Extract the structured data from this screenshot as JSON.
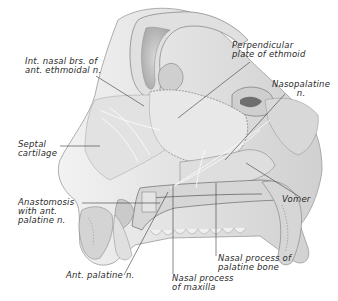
{
  "figure": {
    "colors": {
      "background": "#ffffff",
      "ink": "#2a2a2a",
      "bone_shade": "#b8b8b8",
      "soft_tissue": "#dcdcdc",
      "light_fill": "#ececec",
      "nerve": "#f4f4f4"
    },
    "labels": [
      {
        "id": "int-nasal-brs",
        "lines": [
          "Int. nasal brs. of",
          "ant. ethmoidal n."
        ]
      },
      {
        "id": "perpendicular-plate",
        "lines": [
          "Perpendicular",
          "plate of ethmoid"
        ]
      },
      {
        "id": "nasopalatine",
        "lines": [
          "Nasopalatine",
          "n."
        ]
      },
      {
        "id": "septal-cartilage",
        "lines": [
          "Septal",
          "cartilage"
        ]
      },
      {
        "id": "vomer",
        "lines": [
          "Vomer"
        ]
      },
      {
        "id": "anastomosis",
        "lines": [
          "Anastomosis",
          "with ant.",
          "palatine n."
        ]
      },
      {
        "id": "ant-palatine",
        "lines": [
          "Ant. palatine n."
        ]
      },
      {
        "id": "nasal-process-palatine",
        "lines": [
          "Nasal process of",
          "palatine bone"
        ]
      },
      {
        "id": "nasal-process-maxilla",
        "lines": [
          "Nasal process",
          "of maxilla"
        ]
      }
    ]
  }
}
